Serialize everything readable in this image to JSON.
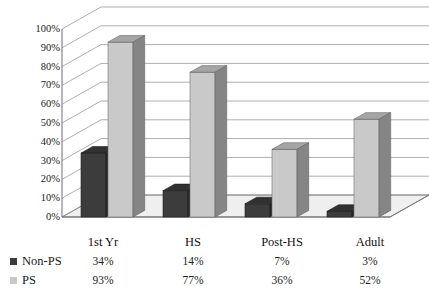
{
  "chart_data": {
    "type": "bar",
    "title": "",
    "subtitle": "",
    "xlabel": "",
    "ylabel": "",
    "categories": [
      "1st Yr",
      "HS",
      "Post-HS",
      "Adult"
    ],
    "series": [
      {
        "name": "Non-PS",
        "values": [
          34,
          14,
          7,
          3
        ],
        "labels": [
          "34%",
          "14%",
          "7%",
          "3%"
        ],
        "color": "#3c3c3c"
      },
      {
        "name": "PS",
        "values": [
          93,
          77,
          36,
          52
        ],
        "labels": [
          "93%",
          "77%",
          "36%",
          "52%"
        ],
        "color": "#c9c9c9"
      }
    ],
    "ylim": [
      0,
      100
    ],
    "yticks": [
      0,
      10,
      20,
      30,
      40,
      50,
      60,
      70,
      80,
      90,
      100
    ],
    "ytick_labels": [
      "0%",
      "10%",
      "20%",
      "30%",
      "40%",
      "50%",
      "60%",
      "70%",
      "80%",
      "90%",
      "100%"
    ],
    "grid": true,
    "grid_axis": "y",
    "legend_position": "bottom-left",
    "style": "3d-clustered-column",
    "has_data_table": true
  },
  "legend": {
    "items": [
      {
        "label": "Non-PS",
        "color": "#3c3c3c"
      },
      {
        "label": "PS",
        "color": "#c9c9c9"
      }
    ]
  },
  "table": {
    "header": [
      "1st Yr",
      "HS",
      "Post-HS",
      "Adult"
    ],
    "rows": [
      {
        "label": "Non-PS",
        "values": [
          "34%",
          "14%",
          "7%",
          "3%"
        ]
      },
      {
        "label": "PS",
        "values": [
          "93%",
          "77%",
          "36%",
          "52%"
        ]
      }
    ]
  },
  "colors": {
    "series_dark": "#3c3c3c",
    "series_light": "#c9c9c9",
    "grid": "#8d8d8d",
    "axis": "#6f6f6f",
    "floor": "#efefef",
    "text": "#1a1a1a"
  }
}
